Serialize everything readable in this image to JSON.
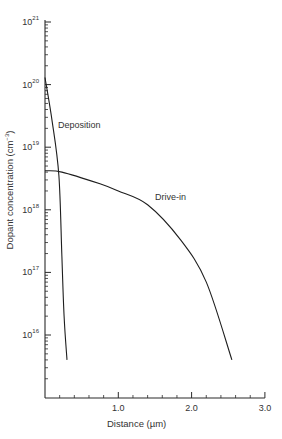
{
  "chart_data": {
    "type": "line",
    "title": "",
    "xlabel": "Distance (µm)",
    "ylabel": "Dopant concentration (cm⁻³)",
    "xscale": "linear",
    "yscale": "log",
    "xlim": [
      0,
      3.0
    ],
    "ylim": [
      1000000000000000.0,
      1e+21
    ],
    "grid": false,
    "legend": "inline labels",
    "x_ticks": [
      {
        "value": 1.0,
        "label": "1.0"
      },
      {
        "value": 2.0,
        "label": "2.0"
      },
      {
        "value": 3.0,
        "label": "3.0"
      }
    ],
    "y_ticks": [
      {
        "value": 1e+16,
        "base": "10",
        "exp": "16"
      },
      {
        "value": 1e+17,
        "base": "10",
        "exp": "17"
      },
      {
        "value": 1e+18,
        "base": "10",
        "exp": "18"
      },
      {
        "value": 1e+19,
        "base": "10",
        "exp": "19"
      },
      {
        "value": 1e+20,
        "base": "10",
        "exp": "20"
      },
      {
        "value": 1e+21,
        "base": "10",
        "exp": "21"
      }
    ],
    "series": [
      {
        "name": "Deposition",
        "x": [
          0.0,
          0.1,
          0.19,
          0.23,
          0.26,
          0.3
        ],
        "y": [
          1.3e+20,
          2.5e+19,
          3.5e+18,
          1.8e+17,
          2e+16,
          4000000000000000.0
        ]
      },
      {
        "name": "Drive-in",
        "x": [
          0.0,
          0.23,
          0.75,
          1.0,
          1.4,
          1.85,
          2.2,
          2.55
        ],
        "y": [
          4.2e+18,
          4e+18,
          2.6e+18,
          2e+18,
          1.2e+18,
          3.3e+17,
          7e+16,
          4000000000000000.0
        ]
      }
    ],
    "annotations": [
      {
        "text": "Deposition",
        "x": 0.15,
        "y": 3.5e+19
      },
      {
        "text": "Drive-in",
        "x": 1.5,
        "y": 1.3e+18
      }
    ]
  },
  "axes": {
    "x_title_main": "Distance (",
    "x_title_unit": "µm",
    "x_title_close": ")",
    "y_title_main": "Dopant concentration (cm",
    "y_title_exp": "−3",
    "y_title_close": ")"
  },
  "labels": {
    "deposition": "Deposition",
    "drive_in": "Drive-in"
  }
}
